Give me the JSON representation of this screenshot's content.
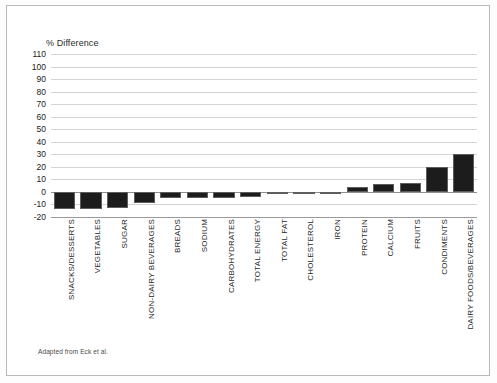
{
  "figure": {
    "source_note": "Adapted from Eck et al.",
    "frame_color": "#b9b9b9",
    "background_color": "#ffffff"
  },
  "chart_data": {
    "type": "bar",
    "title": "",
    "ylabel": "% Difference",
    "xlabel": "",
    "ylim": [
      -20,
      110
    ],
    "ytick_step": 10,
    "yticks": [
      110,
      100,
      90,
      80,
      70,
      60,
      50,
      40,
      30,
      20,
      10,
      0,
      -10,
      -20
    ],
    "ytick_labels": [
      "110",
      "100",
      "90",
      "80",
      "70",
      "60",
      "50",
      "40",
      "30",
      "20",
      "10",
      "0",
      "-10",
      "-20"
    ],
    "grid": true,
    "legend": false,
    "bar_color": "#1c1c1c",
    "bar_edge_color": "#5d5d5d",
    "categories": [
      "SNACKS/DESSERTS",
      "VEGETABLES",
      "SUGAR",
      "NON-DAIRY BEVERAGES",
      "BREADS",
      "SODIUM",
      "CARBOHYDRATES",
      "TOTAL ENERGY",
      "TOTAL FAT",
      "CHOLESTEROL",
      "IRON",
      "PROTEIN",
      "CALCIUM",
      "FRUITS",
      "CONDIMENTS",
      "DAIRY FOODS/BEVERAGES"
    ],
    "values": [
      -14,
      -14,
      -13,
      -9,
      -5,
      -5,
      -5,
      -4,
      -2,
      0,
      0,
      4,
      6,
      7,
      20,
      30
    ]
  }
}
